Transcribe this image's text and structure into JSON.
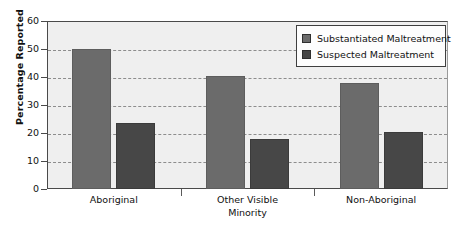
{
  "chart_data": {
    "type": "bar",
    "title": "",
    "xlabel": "",
    "ylabel": "Percentage Reported",
    "ylim": [
      0,
      60
    ],
    "ytick_values": [
      0,
      10,
      20,
      30,
      40,
      50,
      60
    ],
    "ytick_labels": [
      "0",
      "10",
      "20",
      "30",
      "40",
      "50",
      "60"
    ],
    "grid": true,
    "grid_style": "dashed horizontal",
    "legend_position": "top-right",
    "categories": [
      "Aboriginal",
      "Other Visible\nMinority",
      "Non-Aboriginal"
    ],
    "series": [
      {
        "name": "Substantiated Maltreatment",
        "color": "#6b6b6b",
        "values": [
          50,
          40.5,
          37.8
        ]
      },
      {
        "name": "Suspected Maltreatment",
        "color": "#474747",
        "values": [
          23.5,
          17.8,
          20.3
        ]
      }
    ]
  },
  "legend": {
    "items": [
      {
        "label": "Substantiated Maltreatment",
        "swatch": "substantiated-swatch"
      },
      {
        "label": "Suspected Maltreatment",
        "swatch": "suspected-swatch"
      }
    ]
  },
  "axes": {
    "y_title": "Percentage Reported"
  },
  "colors": {
    "substantiated": "#6b6b6b",
    "suspected": "#474747",
    "plot_background": "#efefef",
    "axis": "#4a4a4a",
    "grid": "#8d8d8d",
    "text": "#111111"
  }
}
